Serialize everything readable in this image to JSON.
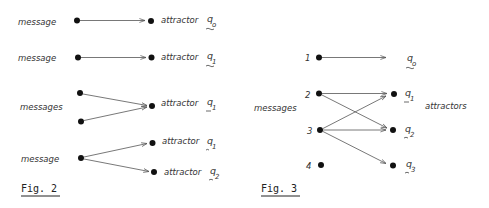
{
  "fig2": {
    "caption": "Fig. 2",
    "rows": [
      {
        "label": "message",
        "targets": [
          {
            "text": "attractor",
            "q": "q",
            "sub": "o"
          }
        ]
      },
      {
        "label": "message",
        "targets": [
          {
            "text": "attractor",
            "q": "q",
            "sub": "1"
          }
        ]
      },
      {
        "label": "messages",
        "targets": [
          {
            "text": "attractor",
            "q": "q",
            "sub": "1"
          }
        ]
      },
      {
        "label": "message",
        "targets": [
          {
            "text": "attractor",
            "q": "q",
            "sub": "1"
          },
          {
            "text": "attractor",
            "q": "q",
            "sub": "2"
          }
        ]
      }
    ]
  },
  "fig3": {
    "caption": "Fig. 3",
    "messages_label": "messages",
    "attractors_label": "attractors",
    "messages": [
      "1",
      "2",
      "3",
      "4"
    ],
    "attractors": [
      {
        "q": "q",
        "sub": "o"
      },
      {
        "q": "q",
        "sub": "1"
      },
      {
        "q": "q",
        "sub": "2"
      },
      {
        "q": "q",
        "sub": "3"
      }
    ],
    "edges": [
      {
        "from": "1",
        "to": "o"
      },
      {
        "from": "2",
        "to": "1"
      },
      {
        "from": "2",
        "to": "2"
      },
      {
        "from": "3",
        "to": "1"
      },
      {
        "from": "3",
        "to": "2"
      },
      {
        "from": "3",
        "to": "3"
      }
    ]
  }
}
